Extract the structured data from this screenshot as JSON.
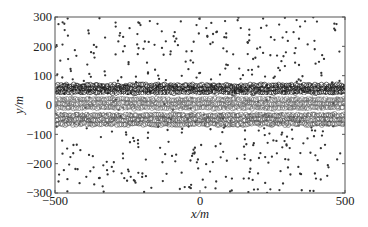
{
  "chart_data": {
    "type": "scatter",
    "title": "",
    "xlabel": "x/m",
    "ylabel": "y/m",
    "xlim": [
      -500,
      500
    ],
    "ylim": [
      -300,
      300
    ],
    "x_ticks": [
      -500,
      0,
      500
    ],
    "y_ticks": [
      -300,
      -200,
      -100,
      0,
      100,
      200,
      300
    ],
    "x_tick_labels": [
      "−500",
      "0",
      "500"
    ],
    "y_tick_labels": [
      "−300",
      "−200",
      "−100",
      "0",
      "100",
      "200",
      "300"
    ],
    "grid": false,
    "legend": null,
    "series": [
      {
        "name": "scattered points",
        "marker": "filled-dot",
        "color": "#333333",
        "distribution": "uniform random",
        "x_range": [
          -500,
          500
        ],
        "y_range": [
          -300,
          300
        ],
        "approx_count": 420
      },
      {
        "name": "dense band row 1 (upper)",
        "marker": "open-circle",
        "color": "#1a1a1a",
        "y_center": 55,
        "y_range": [
          38,
          72
        ],
        "x_range": [
          -500,
          500
        ]
      },
      {
        "name": "dense band row 2 (middle)",
        "marker": "open-circle",
        "color": "#6b6b6b",
        "y_center": 5,
        "y_range": [
          -17,
          27
        ],
        "x_range": [
          -500,
          500
        ]
      },
      {
        "name": "dense band row 3 (lower)",
        "marker": "open-circle",
        "color": "#555555",
        "y_center": -50,
        "y_range": [
          -72,
          -27
        ],
        "x_range": [
          -500,
          500
        ]
      }
    ],
    "annotations": []
  },
  "axes": {
    "xlabel": "x/m",
    "ylabel": "y/m"
  }
}
